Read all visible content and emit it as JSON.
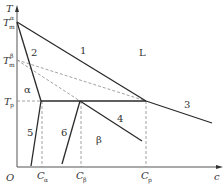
{
  "diagram": {
    "axes": {
      "y_label": "T",
      "x_label": "c",
      "origin_label": "O"
    },
    "temperature_labels": {
      "tm_alpha": {
        "base": "T",
        "sub": "m",
        "sup": "α"
      },
      "tm_beta": {
        "base": "T",
        "sub": "m",
        "sup": "β"
      },
      "tp": {
        "base": "T",
        "sub": "p"
      }
    },
    "concentration_labels": {
      "c_alpha": {
        "base": "C",
        "sub": "α"
      },
      "c_beta": {
        "base": "C",
        "sub": "β"
      },
      "c_p": {
        "base": "C",
        "sub": "p"
      }
    },
    "curve_numbers": [
      "1",
      "2",
      "3",
      "4",
      "5",
      "6"
    ],
    "regions": {
      "liquid": "L",
      "alpha": "α",
      "beta": "β"
    },
    "colors": {
      "solid_line": "#2a2a2a",
      "dashed_line": "#888888",
      "text": "#333333"
    }
  }
}
